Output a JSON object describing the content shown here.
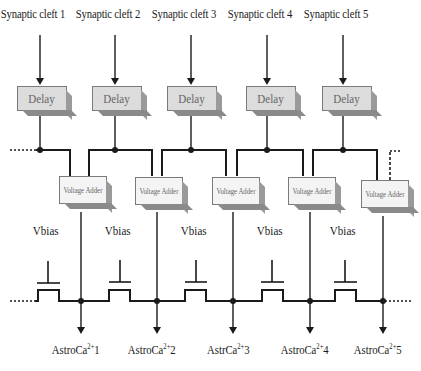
{
  "diagram": {
    "inputs": [
      {
        "label": "Synaptic cleft 1",
        "x": 40
      },
      {
        "label": "Synaptic cleft 2",
        "x": 115
      },
      {
        "label": "Synaptic cleft 3",
        "x": 191
      },
      {
        "label": "Synaptic cleft 4",
        "x": 267
      },
      {
        "label": "Synaptic cleft 5",
        "x": 343
      }
    ],
    "delay": {
      "label": "Delay"
    },
    "adder": {
      "label": "Voltage Adder"
    },
    "vbias": [
      {
        "label": "Vbias"
      },
      {
        "label": "Vbias"
      },
      {
        "label": "Vbias"
      },
      {
        "label": "Vbias"
      },
      {
        "label": "Vbias"
      }
    ],
    "outputs": [
      {
        "prefix": "AstroCa",
        "sup": "2+",
        "suffix": "1"
      },
      {
        "prefix": "AstroCa",
        "sup": "2+",
        "suffix": "2"
      },
      {
        "prefix": "AstrCa",
        "sup": "2+",
        "suffix": "3"
      },
      {
        "prefix": "AstroCa",
        "sup": "2+",
        "suffix": "4"
      },
      {
        "prefix": "AstroCa",
        "sup": "2+",
        "suffix": "5"
      }
    ],
    "colors": {
      "line": "#1a1a1a",
      "delay_fill": "#dcdcdc",
      "adder_fill": "#f4f4f4",
      "shadow": "#8a8a8a"
    }
  }
}
